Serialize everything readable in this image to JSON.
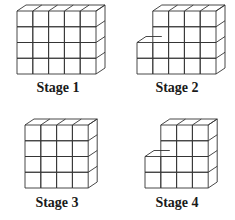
{
  "stages": [
    {
      "label": "Stage 1",
      "columns": [
        4,
        4,
        4,
        4,
        4
      ],
      "origin": [
        17,
        74
      ],
      "label_pos": [
        58,
        80
      ]
    },
    {
      "label": "Stage 2",
      "columns": [
        2,
        4,
        4,
        4,
        4
      ],
      "origin": [
        137,
        74
      ],
      "label_pos": [
        177,
        80
      ]
    },
    {
      "label": "Stage 3",
      "columns": [
        4,
        4,
        4,
        4
      ],
      "origin": [
        25,
        188
      ],
      "label_pos": [
        57,
        195
      ]
    },
    {
      "label": "Stage 4",
      "columns": [
        2,
        4,
        4,
        4
      ],
      "origin": [
        145,
        188
      ],
      "label_pos": [
        177,
        195
      ]
    }
  ],
  "cube": {
    "width": 15.8,
    "height": 15.75,
    "depth_dx": 9,
    "depth_dy": -6
  },
  "colors": {
    "stroke": "#333333",
    "background": "#ffffff",
    "text": "#1a1a1a"
  }
}
